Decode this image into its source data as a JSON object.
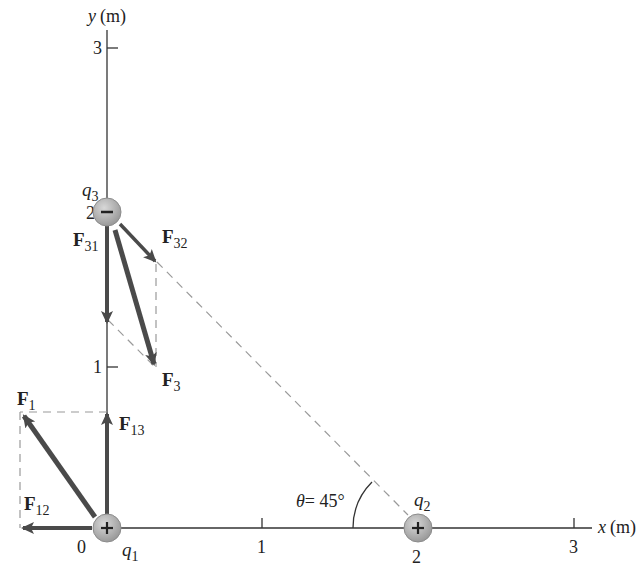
{
  "axes": {
    "x_label_var": "x",
    "x_label_unit": "(m)",
    "y_label_var": "y",
    "y_label_unit": "(m)",
    "x_ticks": [
      "0",
      "1",
      "2",
      "3"
    ],
    "y_ticks": [
      "1",
      "2",
      "3"
    ]
  },
  "charges": {
    "q1": {
      "symbol": "q",
      "sub": "1",
      "sign": "+",
      "position": "(0, 0)"
    },
    "q2": {
      "symbol": "q",
      "sub": "2",
      "sign": "+",
      "position": "(2, 0)"
    },
    "q3": {
      "symbol": "q",
      "sub": "3",
      "sign": "−",
      "position": "(0, 2)"
    }
  },
  "forces": {
    "F1": {
      "main": "F",
      "sub": "1"
    },
    "F12": {
      "main": "F",
      "sub": "12"
    },
    "F13": {
      "main": "F",
      "sub": "13"
    },
    "F3": {
      "main": "F",
      "sub": "3"
    },
    "F31": {
      "main": "F",
      "sub": "31"
    },
    "F32": {
      "main": "F",
      "sub": "32"
    }
  },
  "angle": {
    "symbol": "θ",
    "text": "= 45°"
  },
  "colors": {
    "axis": "#333333",
    "arrow": "#4a4a4a",
    "dashed": "#9a9a9a",
    "charge_fill": "#b8b8b8",
    "charge_stroke": "#8c8c8c",
    "text": "#222222"
  }
}
